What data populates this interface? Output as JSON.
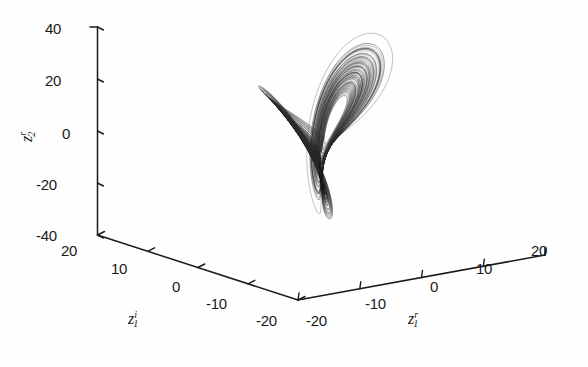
{
  "figure": {
    "background_color": "#fefefe",
    "ink_color": "#1a1a1a",
    "trace_color": "#2a2a2a"
  },
  "chart_data": {
    "type": "line",
    "title": "",
    "subtitle": "",
    "projection": "3d",
    "axes": {
      "x": {
        "label": "z_1^r",
        "label_base": "z",
        "label_sub": "1",
        "label_sup": "r",
        "ticks": [
          -20,
          -10,
          0,
          10,
          20
        ],
        "tick_labels": [
          "-20",
          "-10",
          "0",
          "10",
          "20"
        ],
        "range": [
          -20,
          20
        ],
        "direction": "right-depth"
      },
      "y": {
        "label": "z_1^i",
        "label_base": "z",
        "label_sub": "1",
        "label_sup": "i",
        "ticks": [
          20,
          10,
          0,
          -10,
          -20
        ],
        "tick_labels": [
          "20",
          "10",
          "0",
          "-10",
          "-20"
        ],
        "range": [
          -20,
          20
        ],
        "direction": "left-depth"
      },
      "z": {
        "label": "z_2^r",
        "label_base": "z",
        "label_sub": "2",
        "label_sup": "r",
        "ticks": [
          -40,
          -20,
          0,
          20,
          40
        ],
        "tick_labels": [
          "40",
          "20",
          "0",
          "-20",
          "-40"
        ],
        "range": [
          -40,
          40
        ],
        "direction": "vertical"
      }
    },
    "grid": false,
    "legend": null,
    "series": [
      {
        "name": "attractor trajectory",
        "color": "#2a2a2a",
        "linewidth": 0.4,
        "n_points": 40000,
        "lobe_centers": [
          {
            "x": -9.0,
            "y": 0.0,
            "z": 0.0
          },
          {
            "x": 9.0,
            "y": 0.0,
            "z": 0.0
          }
        ],
        "lobe_radius_xz": [
          11.0,
          16.0
        ],
        "extent_x": [
          -20,
          20
        ],
        "extent_y": [
          -20,
          20
        ],
        "extent_z": [
          -38,
          38
        ]
      }
    ]
  },
  "ticks": {
    "z_vertical": [
      {
        "text": "40",
        "left": 45,
        "top": 21
      },
      {
        "text": "20",
        "left": 45,
        "top": 73
      },
      {
        "text": "0",
        "left": 62,
        "top": 126
      },
      {
        "text": "-20",
        "left": 39,
        "top": 178
      },
      {
        "text": "-40",
        "left": 39,
        "top": 228
      }
    ],
    "y_left": [
      {
        "text": "20",
        "left": 61,
        "top": 243
      },
      {
        "text": "10",
        "left": 111,
        "top": 261
      },
      {
        "text": "0",
        "left": 172,
        "top": 279
      },
      {
        "text": "-10",
        "left": 209,
        "top": 296
      },
      {
        "text": "-20",
        "left": 258,
        "top": 313
      }
    ],
    "x_right": [
      {
        "text": "-20",
        "left": 308,
        "top": 313
      },
      {
        "text": "-10",
        "left": 367,
        "top": 296
      },
      {
        "text": "0",
        "left": 430,
        "top": 279
      },
      {
        "text": "10",
        "left": 476,
        "top": 261
      },
      {
        "text": "20",
        "left": 531,
        "top": 243
      }
    ]
  },
  "axis_titles": {
    "y_axis_left": {
      "left": 128,
      "top": 312
    },
    "x_axis_right": {
      "left": 408,
      "top": 312
    }
  }
}
